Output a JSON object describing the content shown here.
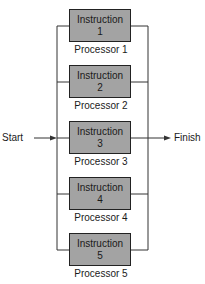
{
  "diagram": {
    "start_label": "Start",
    "finish_label": "Finish",
    "processors": [
      {
        "instruction_label": "Instruction",
        "instruction_number": "1",
        "processor_label": "Processor 1"
      },
      {
        "instruction_label": "Instruction",
        "instruction_number": "2",
        "processor_label": "Processor 2"
      },
      {
        "instruction_label": "Instruction",
        "instruction_number": "3",
        "processor_label": "Processor 3"
      },
      {
        "instruction_label": "Instruction",
        "instruction_number": "4",
        "processor_label": "Processor 4"
      },
      {
        "instruction_label": "Instruction",
        "instruction_number": "5",
        "processor_label": "Processor 5"
      }
    ],
    "colors": {
      "box_fill": "#a3a3a3",
      "line": "#333333"
    }
  }
}
